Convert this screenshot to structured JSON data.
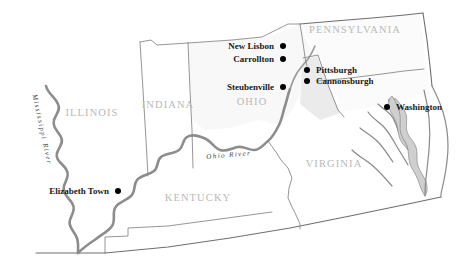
{
  "map": {
    "title": "Historical map of the Ohio Valley region",
    "width": 466,
    "height": 274,
    "background_color": "#ffffff",
    "boundary_color": "#8a8a8a",
    "river_color": "#8d8d8d",
    "state_label_color": "#b9b9b9",
    "city_label_color": "#1a1a1a",
    "bay_color": "#cfcfcf"
  },
  "states": [
    {
      "name": "ILLINOIS",
      "x": 92,
      "y": 116
    },
    {
      "name": "INDIANA",
      "x": 168,
      "y": 108
    },
    {
      "name": "OHIO",
      "x": 252,
      "y": 105
    },
    {
      "name": "PENNSYLVANIA",
      "x": 355,
      "y": 33
    },
    {
      "name": "VIRGINIA",
      "x": 334,
      "y": 167
    },
    {
      "name": "KENTUCKY",
      "x": 198,
      "y": 201
    }
  ],
  "rivers": [
    {
      "name": "Mississippi River",
      "label_x": 40,
      "label_y": 130,
      "orientation": "vertical"
    },
    {
      "name": "Ohio River",
      "label_x": 229,
      "label_y": 157,
      "orientation": "curved"
    }
  ],
  "cities": [
    {
      "name": "New Lisbon",
      "label_x": 274,
      "label_y": 49,
      "dot_x": 283,
      "dot_y": 46,
      "label_side": "left"
    },
    {
      "name": "Carrollton",
      "label_x": 274,
      "label_y": 62,
      "dot_x": 283,
      "dot_y": 59,
      "label_side": "left"
    },
    {
      "name": "Steubenville",
      "label_x": 274,
      "label_y": 90,
      "dot_x": 283,
      "dot_y": 87,
      "label_side": "left"
    },
    {
      "name": "Pittsburgh",
      "label_x": 316,
      "label_y": 73,
      "dot_x": 307,
      "dot_y": 70,
      "label_side": "right"
    },
    {
      "name": "Cannonsburgh",
      "label_x": 316,
      "label_y": 84,
      "dot_x": 307,
      "dot_y": 81,
      "label_side": "right"
    },
    {
      "name": "Washington",
      "label_x": 396,
      "label_y": 110,
      "dot_x": 387,
      "dot_y": 107,
      "label_side": "right"
    },
    {
      "name": "Elizabeth Town",
      "label_x": 109,
      "label_y": 194,
      "dot_x": 118,
      "dot_y": 191,
      "label_side": "left"
    }
  ]
}
